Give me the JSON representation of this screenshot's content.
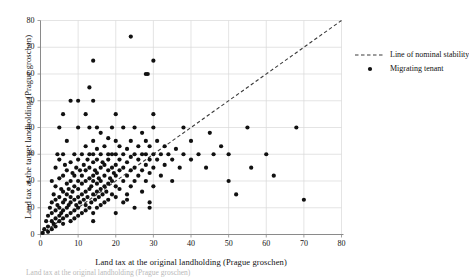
{
  "chart_data": {
    "type": "scatter",
    "title": "",
    "xlabel": "Land tax at the original landholding (Prague groschen)",
    "ylabel": "Land tax at the target landholding (Prague groschen)",
    "xlim": [
      0,
      80
    ],
    "ylim": [
      0,
      80
    ],
    "xticks": [
      0,
      10,
      20,
      30,
      40,
      50,
      60,
      70,
      80
    ],
    "yticks": [
      0,
      10,
      20,
      30,
      40,
      50,
      60,
      70,
      80
    ],
    "grid": true,
    "legend_position": "right",
    "legend": [
      {
        "label": "Line of nominal stability",
        "style": "dashed-line",
        "color": "#3a3a3a"
      },
      {
        "label": "Migrating tenant",
        "style": "marker-dot",
        "color": "#111111"
      }
    ],
    "series": [
      {
        "name": "Line of nominal stability",
        "type": "line",
        "dash": true,
        "color": "#3a3a3a",
        "x": [
          0,
          80
        ],
        "y": [
          0,
          80
        ]
      },
      {
        "name": "Migrating tenant",
        "type": "scatter",
        "marker": "circle",
        "color": "#111111",
        "points": [
          [
            0.6,
            0.6
          ],
          [
            1,
            2
          ],
          [
            1.5,
            5
          ],
          [
            2,
            1
          ],
          [
            2,
            3
          ],
          [
            2,
            7
          ],
          [
            2.5,
            10
          ],
          [
            3,
            2
          ],
          [
            3,
            5
          ],
          [
            3,
            8
          ],
          [
            3,
            12
          ],
          [
            3,
            20
          ],
          [
            3.5,
            4
          ],
          [
            3.5,
            15
          ],
          [
            4,
            3
          ],
          [
            4,
            6
          ],
          [
            4,
            9
          ],
          [
            4,
            13
          ],
          [
            4,
            18
          ],
          [
            4,
            25
          ],
          [
            4.5,
            11
          ],
          [
            4.5,
            30
          ],
          [
            5,
            5
          ],
          [
            5,
            7
          ],
          [
            5,
            10
          ],
          [
            5,
            14
          ],
          [
            5,
            21
          ],
          [
            5,
            28
          ],
          [
            5,
            40
          ],
          [
            5.5,
            8
          ],
          [
            5.5,
            17
          ],
          [
            6,
            4
          ],
          [
            6,
            6
          ],
          [
            6,
            9
          ],
          [
            6,
            12
          ],
          [
            6,
            16
          ],
          [
            6,
            22
          ],
          [
            6,
            30
          ],
          [
            6,
            45
          ],
          [
            6.5,
            13
          ],
          [
            6.5,
            26
          ],
          [
            7,
            7
          ],
          [
            7,
            10
          ],
          [
            7,
            15
          ],
          [
            7,
            19
          ],
          [
            7,
            24
          ],
          [
            7,
            35
          ],
          [
            7.5,
            11
          ],
          [
            7.5,
            17
          ],
          [
            8,
            5
          ],
          [
            8,
            8
          ],
          [
            8,
            12
          ],
          [
            8,
            14
          ],
          [
            8,
            20
          ],
          [
            8,
            27
          ],
          [
            8,
            50
          ],
          [
            8.5,
            16
          ],
          [
            8.5,
            23
          ],
          [
            9,
            6
          ],
          [
            9,
            9
          ],
          [
            9,
            13
          ],
          [
            9,
            18
          ],
          [
            9,
            22
          ],
          [
            9,
            30
          ],
          [
            9.5,
            11
          ],
          [
            9.5,
            25
          ],
          [
            10,
            7
          ],
          [
            10,
            10
          ],
          [
            10,
            14
          ],
          [
            10,
            17
          ],
          [
            10,
            20
          ],
          [
            10,
            28
          ],
          [
            10,
            40
          ],
          [
            10,
            50
          ],
          [
            10.5,
            12
          ],
          [
            10.5,
            24
          ],
          [
            11,
            8
          ],
          [
            11,
            15
          ],
          [
            11,
            19
          ],
          [
            11,
            22
          ],
          [
            11,
            30
          ],
          [
            11.5,
            13
          ],
          [
            11.5,
            26
          ],
          [
            12,
            9
          ],
          [
            12,
            11
          ],
          [
            12,
            16
          ],
          [
            12,
            20
          ],
          [
            12,
            24
          ],
          [
            12,
            33
          ],
          [
            12,
            45
          ],
          [
            12.5,
            14
          ],
          [
            12.5,
            28
          ],
          [
            13,
            10
          ],
          [
            13,
            17
          ],
          [
            13,
            21
          ],
          [
            13,
            25
          ],
          [
            13,
            30
          ],
          [
            13,
            40
          ],
          [
            13,
            55
          ],
          [
            13.5,
            12
          ],
          [
            13.5,
            18
          ],
          [
            14,
            5
          ],
          [
            14,
            8
          ],
          [
            14,
            15
          ],
          [
            14,
            20
          ],
          [
            14,
            22
          ],
          [
            14,
            27
          ],
          [
            14,
            30
          ],
          [
            14,
            35
          ],
          [
            14,
            50
          ],
          [
            14,
            65
          ],
          [
            14.5,
            13
          ],
          [
            14.5,
            24
          ],
          [
            15,
            10
          ],
          [
            15,
            16
          ],
          [
            15,
            19
          ],
          [
            15,
            23
          ],
          [
            15,
            28
          ],
          [
            15,
            32
          ],
          [
            15,
            40
          ],
          [
            15.5,
            14
          ],
          [
            15.5,
            21
          ],
          [
            16,
            11
          ],
          [
            16,
            17
          ],
          [
            16,
            20
          ],
          [
            16,
            25
          ],
          [
            16,
            30
          ],
          [
            16,
            38
          ],
          [
            16.5,
            15
          ],
          [
            16.5,
            27
          ],
          [
            17,
            12
          ],
          [
            17,
            18
          ],
          [
            17,
            22
          ],
          [
            17,
            26
          ],
          [
            17,
            33
          ],
          [
            17.5,
            16
          ],
          [
            18,
            13
          ],
          [
            18,
            19
          ],
          [
            18,
            24
          ],
          [
            18,
            28
          ],
          [
            18,
            30
          ],
          [
            18,
            36
          ],
          [
            18.5,
            21
          ],
          [
            19,
            15
          ],
          [
            19,
            20
          ],
          [
            19,
            25
          ],
          [
            19,
            30
          ],
          [
            19,
            40
          ],
          [
            19.5,
            23
          ],
          [
            20,
            8
          ],
          [
            20,
            14
          ],
          [
            20,
            18
          ],
          [
            20,
            22
          ],
          [
            20,
            26
          ],
          [
            20,
            30
          ],
          [
            20,
            35
          ],
          [
            20,
            45
          ],
          [
            21,
            17
          ],
          [
            21,
            24
          ],
          [
            21,
            28
          ],
          [
            21,
            33
          ],
          [
            22,
            12
          ],
          [
            22,
            20
          ],
          [
            22,
            25
          ],
          [
            22,
            30
          ],
          [
            22,
            40
          ],
          [
            23,
            15
          ],
          [
            23,
            22
          ],
          [
            23,
            27
          ],
          [
            23,
            32
          ],
          [
            23,
            13
          ],
          [
            24,
            18
          ],
          [
            24,
            24
          ],
          [
            24,
            29
          ],
          [
            24,
            35
          ],
          [
            24,
            74
          ],
          [
            25,
            10
          ],
          [
            25,
            20
          ],
          [
            25,
            25
          ],
          [
            25,
            30
          ],
          [
            25,
            40
          ],
          [
            26,
            22
          ],
          [
            26,
            28
          ],
          [
            26,
            33
          ],
          [
            27,
            16
          ],
          [
            27,
            24
          ],
          [
            27,
            30
          ],
          [
            27,
            38
          ],
          [
            28,
            20
          ],
          [
            28,
            26
          ],
          [
            28,
            30
          ],
          [
            28,
            35
          ],
          [
            28,
            60
          ],
          [
            28.5,
            60
          ],
          [
            29,
            23
          ],
          [
            29,
            28
          ],
          [
            29,
            33
          ],
          [
            29,
            10
          ],
          [
            29,
            12
          ],
          [
            30,
            18
          ],
          [
            30,
            25
          ],
          [
            30,
            30
          ],
          [
            30,
            40
          ],
          [
            30,
            45
          ],
          [
            30,
            65
          ],
          [
            31,
            28
          ],
          [
            31,
            35
          ],
          [
            32,
            22
          ],
          [
            32,
            30
          ],
          [
            33,
            26
          ],
          [
            33,
            33
          ],
          [
            34,
            30
          ],
          [
            35,
            20
          ],
          [
            35,
            28
          ],
          [
            36,
            32
          ],
          [
            37,
            25
          ],
          [
            38,
            30
          ],
          [
            38,
            40
          ],
          [
            40,
            28
          ],
          [
            40,
            35
          ],
          [
            42,
            30
          ],
          [
            44,
            25
          ],
          [
            45,
            38
          ],
          [
            46,
            30
          ],
          [
            48,
            33
          ],
          [
            50,
            20
          ],
          [
            50,
            30
          ],
          [
            52,
            15
          ],
          [
            55,
            40
          ],
          [
            56,
            25
          ],
          [
            60,
            30
          ],
          [
            62,
            22
          ],
          [
            68,
            40
          ],
          [
            70,
            13
          ]
        ]
      }
    ]
  },
  "axis": {
    "x_tick_labels": [
      "0",
      "10",
      "20",
      "30",
      "40",
      "50",
      "60",
      "70",
      "80"
    ],
    "y_tick_labels": [
      "0",
      "10",
      "20",
      "30",
      "40",
      "50",
      "60",
      "70",
      "80"
    ]
  },
  "caption": "Land tax at the original landholding (Prague groschen)"
}
